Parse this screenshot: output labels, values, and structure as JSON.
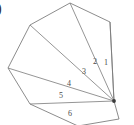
{
  "figure": {
    "caption_mark": ")",
    "polygon": {
      "name": "octagon",
      "sides": 8,
      "vertices": [
        {
          "id": "v0",
          "x": 114,
          "y": 101,
          "role": "fan-center"
        },
        {
          "id": "v1",
          "x": 110,
          "y": 22
        },
        {
          "id": "v2",
          "x": 70,
          "y": 3
        },
        {
          "id": "v3",
          "x": 30,
          "y": 25
        },
        {
          "id": "v4",
          "x": 8,
          "y": 68
        },
        {
          "id": "v5",
          "x": 30,
          "y": 104
        },
        {
          "id": "v6",
          "x": 78,
          "y": 126
        },
        {
          "id": "v7",
          "x": 119,
          "y": 119
        }
      ]
    },
    "diagonals": [
      {
        "from": "v0",
        "to": "v1"
      },
      {
        "from": "v0",
        "to": "v2"
      },
      {
        "from": "v0",
        "to": "v3"
      },
      {
        "from": "v0",
        "to": "v4"
      },
      {
        "from": "v0",
        "to": "v5"
      }
    ],
    "triangle_labels": [
      {
        "text": "1",
        "x": 106,
        "y": 63
      },
      {
        "text": "2",
        "x": 95,
        "y": 62
      },
      {
        "text": "3",
        "x": 84,
        "y": 72
      },
      {
        "text": "4",
        "x": 69,
        "y": 84
      },
      {
        "text": "5",
        "x": 61,
        "y": 96
      },
      {
        "text": "6",
        "x": 70,
        "y": 114
      }
    ],
    "colors": {
      "stroke": "#6e6e6e",
      "diagonal": "#7a7a7a",
      "fill": "#ffffff",
      "label": "#4a4a4a",
      "vertex_dot": "#3a3a3a"
    }
  }
}
